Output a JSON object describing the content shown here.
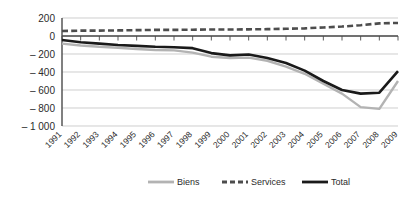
{
  "chart_data": {
    "type": "line",
    "title": "",
    "xlabel": "",
    "ylabel": "",
    "categories": [
      "1991",
      "1992",
      "1993",
      "1994",
      "1995",
      "1996",
      "1997",
      "1998",
      "1999",
      "2000",
      "2001",
      "2002",
      "2003",
      "2004",
      "2005",
      "2006",
      "2007",
      "2008",
      "2009"
    ],
    "ylim": [
      -1000,
      200
    ],
    "yticks": [
      200,
      0,
      -200,
      -400,
      -600,
      -800,
      -1000
    ],
    "ytick_labels": [
      "200",
      "0",
      "– 200",
      "– 400",
      "– 600",
      "– 800",
      "– 1 000"
    ],
    "grid": true,
    "legend_position": "bottom",
    "series": [
      {
        "name": "Biens",
        "color": "#b3b3b3",
        "style": "solid",
        "values": [
          -85,
          -105,
          -120,
          -130,
          -145,
          -155,
          -160,
          -185,
          -230,
          -245,
          -240,
          -275,
          -340,
          -420,
          -530,
          -640,
          -790,
          -810,
          -500
        ]
      },
      {
        "name": "Services",
        "color": "#4d4d4d",
        "style": "dashed",
        "values": [
          55,
          60,
          60,
          62,
          65,
          68,
          68,
          70,
          72,
          72,
          74,
          76,
          80,
          85,
          95,
          105,
          120,
          140,
          145
        ]
      },
      {
        "name": "Total",
        "color": "#1a1a1a",
        "style": "solid",
        "values": [
          -45,
          -70,
          -85,
          -100,
          -110,
          -120,
          -125,
          -135,
          -190,
          -215,
          -205,
          -245,
          -300,
          -385,
          -500,
          -600,
          -640,
          -630,
          -390
        ]
      }
    ]
  },
  "legend": {
    "items": [
      {
        "label": "Biens"
      },
      {
        "label": "Services"
      },
      {
        "label": "Total"
      }
    ]
  }
}
